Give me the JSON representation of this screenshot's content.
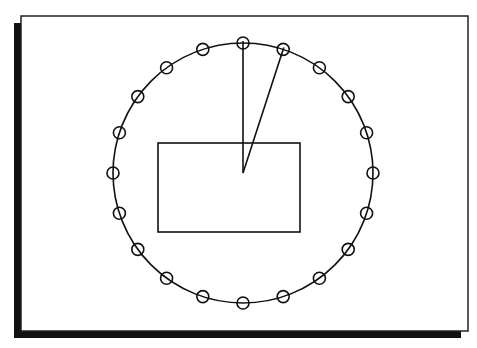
{
  "diagram": {
    "frame": {
      "x": 21,
      "y": 16,
      "width": 447,
      "height": 315,
      "stroke": "#222222",
      "fill": "#ffffff",
      "shadow": "#111111",
      "shadow_offset": 7
    },
    "clock": {
      "cx": 243,
      "cy": 173,
      "r": 130,
      "marker_count": 20,
      "marker_r": 6,
      "stroke": "#111111"
    },
    "hands": [
      {
        "name": "hand-vertical",
        "angle_deg": 0,
        "length": 132
      },
      {
        "name": "hand-angled",
        "angle_deg": 18,
        "length": 132
      }
    ],
    "rectangle": {
      "x": 158,
      "y": 143,
      "width": 142,
      "height": 89
    }
  }
}
